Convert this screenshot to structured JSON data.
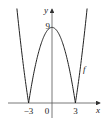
{
  "chart_data": {
    "type": "line",
    "title": "",
    "function": "f(x) = |9 - x^2|",
    "xlabel": "x",
    "ylabel": "y",
    "curve_label": "f",
    "xlim": [
      -5.5,
      6.2
    ],
    "ylim": [
      0,
      11
    ],
    "x_ticks": [
      {
        "value": -3,
        "label": "−3"
      },
      {
        "value": 0,
        "label": "0"
      },
      {
        "value": 3,
        "label": "3"
      }
    ],
    "y_ticks": [
      {
        "value": 9,
        "label": "9"
      }
    ],
    "grid": false,
    "series": [
      {
        "name": "f",
        "x_range": [
          -4.5,
          4.5
        ],
        "samples": 181
      }
    ]
  }
}
